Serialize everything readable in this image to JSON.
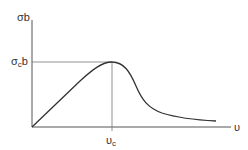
{
  "diagram": {
    "type": "curve-sketch",
    "y_axis_label": "σb",
    "y_marker_label_main": "σ",
    "y_marker_label_sub": "c",
    "y_marker_label_tail": "b",
    "x_axis_label": "υ",
    "x_marker_label_main": "υ",
    "x_marker_label_sub": "c",
    "colors": {
      "line": "#333333",
      "guide": "#555555",
      "background": "#ffffff"
    },
    "curve_points": [
      [
        32,
        127
      ],
      [
        56,
        104
      ],
      [
        80,
        81
      ],
      [
        96,
        68
      ],
      [
        112,
        62
      ],
      [
        124,
        66
      ],
      [
        134,
        80
      ],
      [
        142,
        98
      ],
      [
        152,
        108
      ],
      [
        170,
        116
      ],
      [
        195,
        120
      ],
      [
        216,
        121
      ]
    ],
    "peak": {
      "x": 112,
      "y": 62
    }
  }
}
